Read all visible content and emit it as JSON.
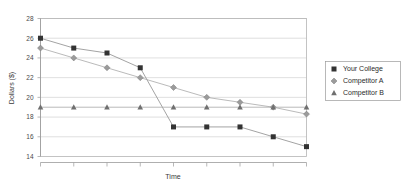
{
  "chart_data": {
    "type": "line",
    "title": "",
    "xlabel": "Time",
    "ylabel": "Dollars ($)",
    "ylim": [
      14,
      28
    ],
    "ytick_labels": [
      "28",
      "26",
      "24",
      "22",
      "20",
      "18",
      "16",
      "14"
    ],
    "yticks": [
      28,
      26,
      24,
      22,
      20,
      18,
      16,
      14
    ],
    "xlim": [
      0,
      8
    ],
    "x": [
      0,
      1,
      2,
      3,
      4,
      5,
      6,
      7,
      8
    ],
    "xtick_labels": [
      "",
      "",
      "",
      "",
      "",
      "",
      "",
      "",
      ""
    ],
    "grid": true,
    "legend_position": "right",
    "series": [
      {
        "name": "Your College",
        "marker": "square",
        "color": "#333333",
        "line_color": "#8c8c8c",
        "values": [
          26,
          25,
          24.5,
          23,
          17,
          17,
          17,
          16,
          15
        ]
      },
      {
        "name": "Competitor A",
        "marker": "diamond",
        "color": "#9b9b9b",
        "line_color": "#a8a8a8",
        "values": [
          25,
          24,
          23,
          22,
          21,
          20,
          19.5,
          19,
          18.3
        ]
      },
      {
        "name": "Competitor B",
        "marker": "triangle",
        "color": "#6f6f6f",
        "line_color": "#a8a8a8",
        "values": [
          19,
          19,
          19,
          19,
          19,
          19,
          19,
          19,
          19
        ]
      }
    ]
  },
  "legend": {
    "items": [
      {
        "label": "Your College"
      },
      {
        "label": "Competitor A"
      },
      {
        "label": "Competitor B"
      }
    ]
  },
  "axes": {
    "y_title": "Dollars ($)",
    "x_title": "Time"
  },
  "colors": {
    "grid": "#c9c9c9",
    "axis": "#9a9a9a",
    "series_1": "#333333",
    "series_2": "#9b9b9b",
    "series_3": "#6f6f6f",
    "background": "#ffffff"
  }
}
